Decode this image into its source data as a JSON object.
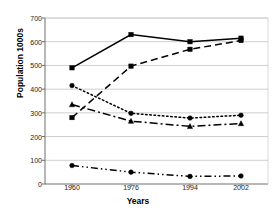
{
  "chart_data": {
    "type": "line",
    "title": "",
    "xlabel": "Years",
    "ylabel": "Population 1000s",
    "x": [
      1960,
      1976,
      1994,
      2002
    ],
    "categories": [
      "1960",
      "1976",
      "1994",
      "2002"
    ],
    "ylim": [
      0,
      700
    ],
    "yticks": [
      0,
      100,
      200,
      300,
      400,
      500,
      600,
      700
    ],
    "ytick_labels": [
      "0",
      "100",
      "200",
      "300",
      "400",
      "500",
      "600",
      "700"
    ],
    "xtick_labels": [
      "1960",
      "1976",
      "1994",
      "2002"
    ],
    "grid": "horizontal",
    "legend": "none",
    "series": [
      {
        "name": "series-1",
        "line_style": "solid",
        "marker": "square",
        "color": "#000000",
        "values": [
          490,
          630,
          600,
          615
        ]
      },
      {
        "name": "series-2",
        "line_style": "dashed",
        "marker": "square",
        "color": "#000000",
        "values": [
          280,
          497,
          568,
          605
        ]
      },
      {
        "name": "series-3",
        "line_style": "dotted",
        "marker": "circle",
        "color": "#000000",
        "values": [
          415,
          298,
          278,
          290
        ]
      },
      {
        "name": "series-4",
        "line_style": "dash-dot",
        "marker": "triangle",
        "color": "#000000",
        "values": [
          335,
          265,
          243,
          255
        ]
      },
      {
        "name": "series-5",
        "line_style": "dash-dot-dot",
        "marker": "circle",
        "color": "#000000",
        "values": [
          78,
          50,
          32,
          34
        ]
      }
    ]
  },
  "axis": {
    "y_title": "Population 1000s",
    "x_title": "Years",
    "y_labels": [
      "700",
      "600",
      "500",
      "400",
      "300",
      "200",
      "100",
      "0"
    ],
    "x_labels": [
      "1960",
      "1976",
      "1994",
      "2002"
    ]
  }
}
